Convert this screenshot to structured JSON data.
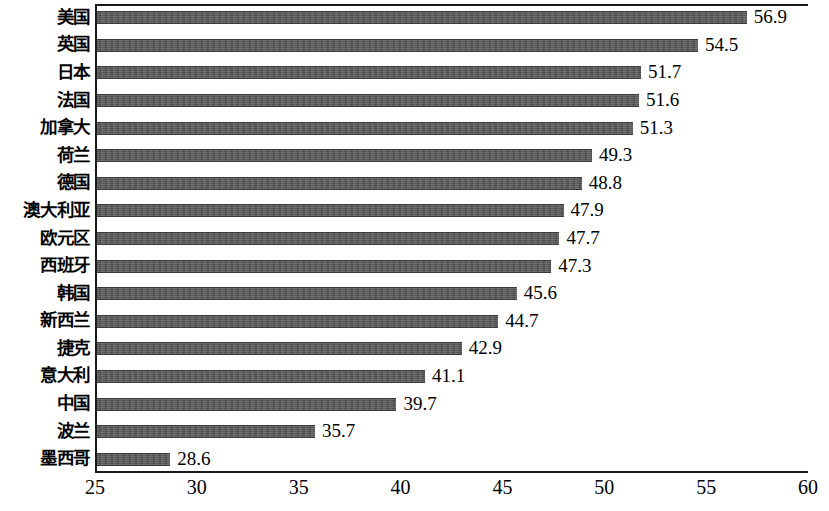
{
  "chart_data": {
    "type": "bar",
    "orientation": "horizontal",
    "title": "",
    "subtitle": "",
    "xlabel": "",
    "ylabel": "",
    "xlim": [
      25,
      60
    ],
    "xticks": [
      25,
      30,
      35,
      40,
      45,
      50,
      55,
      60
    ],
    "xtick_labels": [
      "25",
      "30",
      "35",
      "40",
      "45",
      "50",
      "55",
      "60"
    ],
    "grid": false,
    "legend": false,
    "bar_color": "#565656",
    "categories": [
      "美国",
      "英国",
      "日本",
      "法国",
      "加拿大",
      "荷兰",
      "德国",
      "澳大利亚",
      "欧元区",
      "西班牙",
      "韩国",
      "新西兰",
      "捷克",
      "意大利",
      "中国",
      "波兰",
      "墨西哥"
    ],
    "values": [
      56.9,
      54.5,
      51.7,
      51.6,
      51.3,
      49.3,
      48.8,
      47.9,
      47.7,
      47.3,
      45.6,
      44.7,
      42.9,
      41.1,
      39.7,
      35.7,
      28.6
    ],
    "value_labels": [
      "56.9",
      "54.5",
      "51.7",
      "51.6",
      "51.3",
      "49.3",
      "48.8",
      "47.9",
      "47.7",
      "47.3",
      "45.6",
      "44.7",
      "42.9",
      "41.1",
      "39.7",
      "35.7",
      "28.6"
    ]
  }
}
